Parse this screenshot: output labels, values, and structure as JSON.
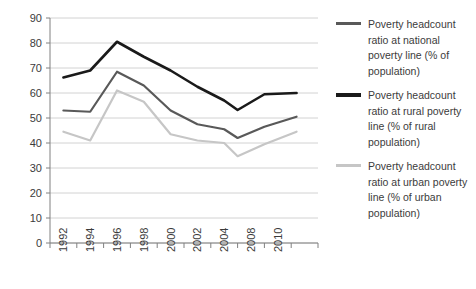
{
  "chart_data": {
    "type": "line",
    "title": "",
    "xlabel": "",
    "ylabel": "",
    "x": [
      "1992",
      "1994",
      "1996",
      "1998",
      "2000",
      "2002",
      "2004",
      "2008",
      "2010"
    ],
    "categories": [
      "1992",
      "1994",
      "1996",
      "1998",
      "2000",
      "2002",
      "2004",
      "2008",
      "2010"
    ],
    "ylim": [
      0,
      90
    ],
    "yticks": [
      0,
      10,
      20,
      30,
      40,
      50,
      60,
      70,
      80,
      90
    ],
    "ytick_labels": [
      "0",
      "10",
      "20",
      "30",
      "40",
      "50",
      "60",
      "70",
      "80",
      "90"
    ],
    "grid": true,
    "legend_position": "right",
    "series": [
      {
        "name": "Poverty headcount ratio at national poverty line (% of population)",
        "color": "#595959",
        "x": [
          1992,
          1994,
          1996,
          1998,
          2000,
          2002,
          2004,
          2005,
          2008,
          2010
        ],
        "values": [
          53,
          52.5,
          68.5,
          63,
          53,
          47.5,
          45.5,
          42,
          46.5,
          50.5
        ]
      },
      {
        "name": "Poverty headcount ratio at rural poverty line (% of rural population)",
        "color": "#1a1a1a",
        "x": [
          1992,
          1994,
          1996,
          1998,
          2000,
          2002,
          2004,
          2005,
          2008,
          2010
        ],
        "values": [
          66.2,
          69,
          80.5,
          74.5,
          69,
          62.5,
          57,
          53.2,
          59.5,
          60
        ]
      },
      {
        "name": "Poverty headcount ratio at urban poverty line (% of urban population)",
        "color": "#c6c6c6",
        "x": [
          1992,
          1994,
          1996,
          1998,
          2000,
          2002,
          2004,
          2005,
          2008,
          2010
        ],
        "values": [
          44.5,
          41,
          61,
          56.5,
          43.5,
          41,
          40,
          34.7,
          39.5,
          44.5
        ]
      }
    ]
  },
  "legend": {
    "items": [
      {
        "label": "Poverty headcount ratio at national poverty line (% of population)",
        "color": "#595959",
        "thickness": 3
      },
      {
        "label": "Poverty headcount ratio at rural poverty line (% of rural population)",
        "color": "#1a1a1a",
        "thickness": 4
      },
      {
        "label": "Poverty headcount ratio at urban poverty line (% of urban population)",
        "color": "#c6c6c6",
        "thickness": 3
      }
    ]
  },
  "axes": {
    "gridline_color": "#d2d2d2",
    "axis_color": "#808080",
    "tick_text_color": "#3b3b3b"
  }
}
